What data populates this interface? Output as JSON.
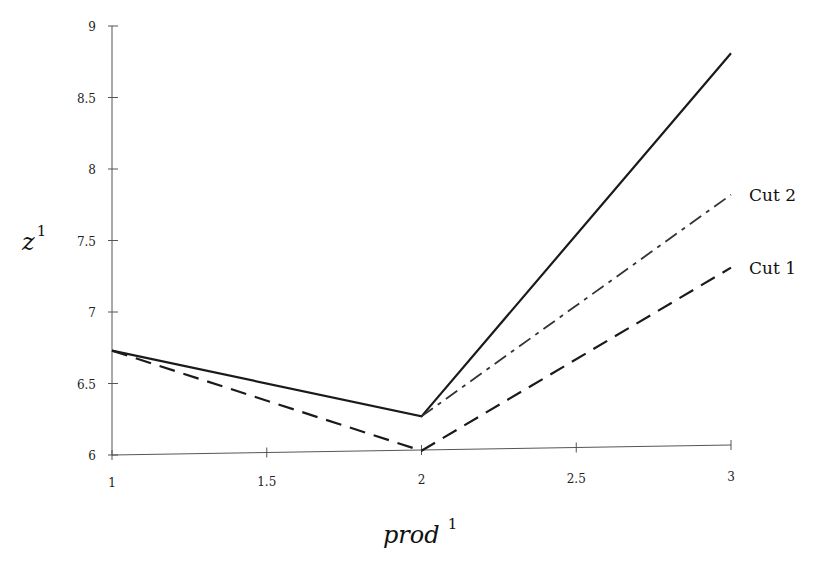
{
  "chart_data": {
    "type": "line",
    "title": "",
    "xlabel": "prod",
    "xlabel_superscript": "1",
    "ylabel": "z",
    "ylabel_superscript": "1",
    "xlim": [
      1,
      3
    ],
    "ylim": [
      6,
      9
    ],
    "grid": false,
    "x_ticks": [
      1,
      1.5,
      2,
      2.5,
      3
    ],
    "x_tick_labels": [
      "1",
      "1.5",
      "2",
      "2.5",
      "3"
    ],
    "y_ticks": [
      6,
      6.5,
      7,
      7.5,
      8,
      8.5,
      9
    ],
    "y_tick_labels": [
      "6",
      "6.5",
      "7",
      "7.5",
      "8",
      "8.5",
      "9"
    ],
    "series": [
      {
        "name": "Objective",
        "style": "solid",
        "label": "",
        "x": [
          1,
          2,
          3
        ],
        "y": [
          6.73,
          6.27,
          8.81
        ]
      },
      {
        "name": "Cut 2",
        "style": "dashdot",
        "label": "Cut 2",
        "x": [
          2,
          3
        ],
        "y": [
          6.27,
          7.82
        ]
      },
      {
        "name": "Cut 1",
        "style": "dashed",
        "label": "Cut 1",
        "x": [
          1,
          2,
          3
        ],
        "y": [
          6.73,
          6.03,
          7.31
        ]
      }
    ]
  }
}
